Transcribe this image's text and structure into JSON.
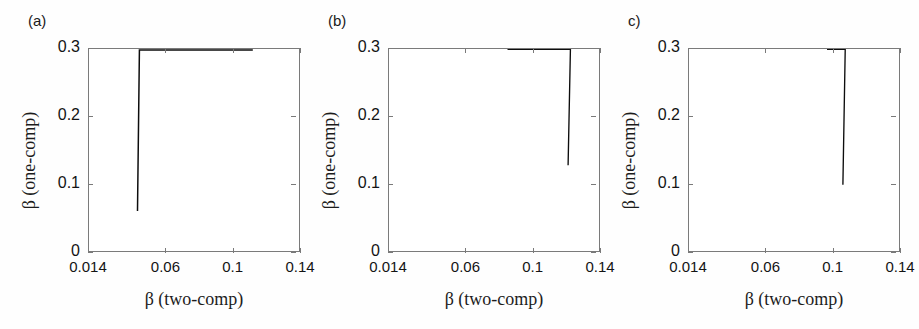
{
  "figure": {
    "background": "#fefefe",
    "marker": "x-cross",
    "marker_color": "#0d0d0d",
    "axis_color": "#7a7a7a"
  },
  "axes": {
    "xlabel": "β (two-comp)",
    "ylabel": "β (one-comp)",
    "xticks": [
      "0.014",
      "0.06",
      "0.1",
      "0.14"
    ],
    "xtick_values": [
      0.014,
      0.06,
      0.1,
      0.14
    ],
    "yticks": [
      "0",
      "0.1",
      "0.2",
      "0.3"
    ],
    "ytick_values": [
      0,
      0.1,
      0.2,
      0.3
    ],
    "xlim": [
      0.014,
      0.14
    ],
    "ylim": [
      0,
      0.3
    ],
    "grid": false,
    "legend": "none"
  },
  "panels": [
    {
      "label": "(a)",
      "name": "panel-a"
    },
    {
      "label": "(b)",
      "name": "panel-b"
    },
    {
      "label": "c)",
      "name": "panel-c"
    }
  ],
  "chart_data": [
    {
      "type": "scatter",
      "title": "(a)",
      "xlabel": "β (two-comp)",
      "ylabel": "β (one-comp)",
      "xlim": [
        0.014,
        0.14
      ],
      "ylim": [
        0,
        0.3
      ],
      "xticks": [
        0.014,
        0.06,
        0.1,
        0.14
      ],
      "yticks": [
        0,
        0.1,
        0.2,
        0.3
      ],
      "grid": false,
      "marker": "x",
      "description": "Very dense saturated diagonal band from (0.014,0.02) to (0.14,0.13); sparse low outliers below the band.",
      "band": {
        "slope": 0.92,
        "intercept": 0.012,
        "half_width": 0.018,
        "n_points": 2600
      },
      "outliers_below": {
        "n_points": 70,
        "y_fraction_of_band": [
          0.05,
          0.6
        ]
      },
      "outliers_above": {
        "n_points": 0,
        "ymax": 0.15
      }
    },
    {
      "type": "scatter",
      "title": "(b)",
      "xlabel": "β (two-comp)",
      "ylabel": "β (one-comp)",
      "xlim": [
        0.014,
        0.14
      ],
      "ylim": [
        0,
        0.3
      ],
      "xticks": [
        0.014,
        0.06,
        0.1,
        0.14
      ],
      "yticks": [
        0,
        0.1,
        0.2,
        0.3
      ],
      "grid": false,
      "marker": "x",
      "description": "Dense diagonal band from (0.014,0.015) to (0.14,0.13) with moderate scatter; many outliers above reaching y = 0.26 near x = 0.105.",
      "band": {
        "slope": 0.95,
        "intercept": 0.004,
        "half_width": 0.011,
        "n_points": 1500
      },
      "outliers_below": {
        "n_points": 60,
        "y_fraction_of_band": [
          0.0,
          0.7
        ]
      },
      "outliers_above": {
        "n_points": 120,
        "ymax": 0.26
      }
    },
    {
      "type": "scatter",
      "title": "c)",
      "xlabel": "β (two-comp)",
      "ylabel": "β (one-comp)",
      "xlim": [
        0.014,
        0.14
      ],
      "ylim": [
        0,
        0.3
      ],
      "xticks": [
        0.014,
        0.06,
        0.1,
        0.14
      ],
      "yticks": [
        0,
        0.1,
        0.2,
        0.3
      ],
      "grid": false,
      "marker": "x",
      "description": "Broad diagonal band from (0.014,0.02) to (0.14,0.12) with large vertical spread; numerous high outliers up to y = 0.28 near x = 0.12, plus a row of points pinned at y = 0.",
      "band": {
        "slope": 0.82,
        "intercept": 0.012,
        "half_width": 0.016,
        "n_points": 1400
      },
      "outliers_below": {
        "n_points": 110,
        "y_fraction_of_band": [
          0.0,
          0.7
        ]
      },
      "outliers_above": {
        "n_points": 150,
        "ymax": 0.28
      },
      "zero_floor_points": 26
    }
  ]
}
